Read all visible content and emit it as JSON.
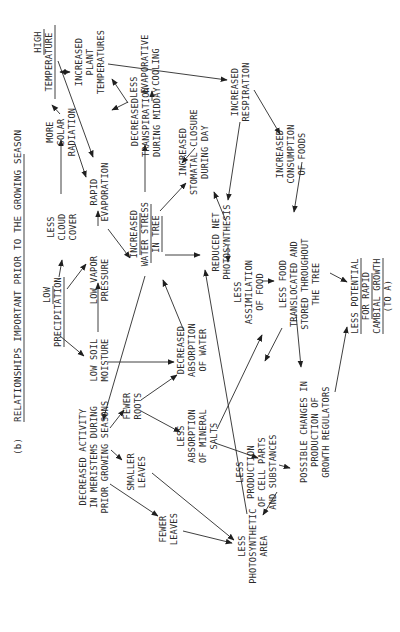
{
  "title": {
    "label": "(b)",
    "text": "RELATIONSHIPS IMPORTANT PRIOR TO THE GROWING SEASON"
  },
  "nodes": {
    "low_precipitation": {
      "lines": [
        "LOW",
        "PRECIPITATION"
      ],
      "underlined": true
    },
    "high_temperature": {
      "lines": [
        "HIGH",
        "TEMPERATURE"
      ],
      "underlined": true
    },
    "increased_plant_temperatures": {
      "lines": [
        "INCREASED",
        "PLANT",
        "TEMPERATURES"
      ]
    },
    "less_cloud_cover": {
      "lines": [
        "LESS",
        "CLOUD",
        "COVER"
      ]
    },
    "more_solar_radiation": {
      "lines": [
        "MORE",
        "SOLAR",
        "RADIATION"
      ]
    },
    "low_vapor_pressure": {
      "lines": [
        "LOW VAPOR",
        "PRESSURE"
      ]
    },
    "rapid_evaporation": {
      "lines": [
        "RAPID",
        "EVAPORATION"
      ]
    },
    "less_evaporative_cooling": {
      "lines": [
        "LESS",
        "EVAPORATIVE",
        "COOLING"
      ]
    },
    "decreased_transpiration": {
      "lines": [
        "DECREASED",
        "TRANSPIRATION",
        "DURING MIDDAY"
      ]
    },
    "increased_stomatal_closure": {
      "lines": [
        "INCREASED",
        "STOMATAL CLOSURE",
        "DURING DAY"
      ]
    },
    "increased_respiration": {
      "lines": [
        "INCREASED",
        "RESPIRATION"
      ]
    },
    "increased_consumption": {
      "lines": [
        "INCREASED",
        "CONSUMPTION",
        "OF FOODS"
      ]
    },
    "low_soil_moisture": {
      "lines": [
        "LOW SOIL",
        "MOISTURE"
      ]
    },
    "increased_water_stress": {
      "lines": [
        "INCREASED",
        "WATER STRESS",
        "IN TREE"
      ],
      "underlined": true
    },
    "reduced_net_photosynthesis": {
      "lines": [
        "REDUCED NET",
        "PHOTOSYNTHESIS"
      ]
    },
    "less_assimilation": {
      "lines": [
        "LESS",
        "ASSIMILATION",
        "OF FOOD"
      ]
    },
    "less_food_translocated": {
      "lines": [
        "LESS FOOD",
        "TRANSLOCATED AND",
        "STORED THROUGHOUT",
        "THE TREE"
      ]
    },
    "less_potential": {
      "lines": [
        "LESS POTENTIAL",
        "FOR RAPID",
        "CAMBIAL GROWTH",
        "(TO A)"
      ],
      "underlined": true
    },
    "decreased_absorption_water": {
      "lines": [
        "DECREASED",
        "ABSORPTION",
        "OF WATER"
      ]
    },
    "fewer_roots": {
      "lines": [
        "FEWER",
        "ROOTS"
      ]
    },
    "decreased_activity_meristems": {
      "lines": [
        "DECREASED ACTIVITY",
        "IN MERISTEMS DURING",
        "PRIOR GROWING SEASONS"
      ]
    },
    "less_absorption_mineral": {
      "lines": [
        "LESS",
        "ABSORPTION",
        "OF MINERAL",
        "SALTS"
      ]
    },
    "less_production_cell_parts": {
      "lines": [
        "LESS",
        "PRODUCTION",
        "OF CELL PARTS",
        "AND SUBSTANCES"
      ]
    },
    "possible_changes_regulators": {
      "lines": [
        "POSSIBLE CHANGES IN",
        "PRODUCTION OF",
        "GROWTH REGULATORS"
      ]
    },
    "smaller_leaves": {
      "lines": [
        "SMALLER",
        "LEAVES"
      ]
    },
    "fewer_leaves": {
      "lines": [
        "FEWER",
        "LEAVES"
      ]
    },
    "less_photosynthetic_area": {
      "lines": [
        "LESS",
        "PHOTOSYNTHETIC",
        "AREA"
      ]
    }
  },
  "edges": [
    [
      "low_precipitation",
      "less_cloud_cover"
    ],
    [
      "low_precipitation",
      "low_vapor_pressure"
    ],
    [
      "low_precipitation",
      "low_soil_moisture"
    ],
    [
      "less_cloud_cover",
      "more_solar_radiation"
    ],
    [
      "more_solar_radiation",
      "high_temperature"
    ],
    [
      "high_temperature",
      "increased_plant_temperatures"
    ],
    [
      "increased_plant_temperatures",
      "high_temperature"
    ],
    [
      "high_temperature",
      "rapid_evaporation"
    ],
    [
      "more_solar_radiation",
      "rapid_evaporation"
    ],
    [
      "low_vapor_pressure",
      "rapid_evaporation"
    ],
    [
      "low_soil_moisture",
      "low_vapor_pressure"
    ],
    [
      "rapid_evaporation",
      "increased_water_stress"
    ],
    [
      "increased_water_stress",
      "decreased_transpiration"
    ],
    [
      "decreased_transpiration",
      "less_evaporative_cooling"
    ],
    [
      "less_evaporative_cooling",
      "increased_plant_temperatures"
    ],
    [
      "increased_plant_temperatures",
      "increased_respiration"
    ],
    [
      "increased_respiration",
      "increased_consumption"
    ],
    [
      "increased_respiration",
      "reduced_net_photosynthesis"
    ],
    [
      "increased_stomatal_closure",
      "decreased_transpiration"
    ],
    [
      "increased_water_stress",
      "increased_stomatal_closure"
    ],
    [
      "reduced_net_photosynthesis",
      "increased_stomatal_closure"
    ],
    [
      "increased_water_stress",
      "reduced_net_photosynthesis"
    ],
    [
      "increased_water_stress",
      "decreased_activity_meristems"
    ],
    [
      "reduced_net_photosynthesis",
      "less_assimilation"
    ],
    [
      "less_assimilation",
      "less_food_translocated"
    ],
    [
      "increased_consumption",
      "less_food_translocated"
    ],
    [
      "less_food_translocated",
      "less_potential"
    ],
    [
      "less_food_translocated",
      "less_production_cell_parts"
    ],
    [
      "less_food_translocated",
      "possible_changes_regulators"
    ],
    [
      "possible_changes_regulators",
      "less_potential"
    ],
    [
      "low_soil_moisture",
      "decreased_absorption_water"
    ],
    [
      "decreased_absorption_water",
      "increased_water_stress"
    ],
    [
      "fewer_roots",
      "decreased_absorption_water"
    ],
    [
      "fewer_roots",
      "less_absorption_mineral"
    ],
    [
      "decreased_activity_meristems",
      "fewer_roots"
    ],
    [
      "decreased_activity_meristems",
      "smaller_leaves"
    ],
    [
      "decreased_activity_meristems",
      "fewer_leaves"
    ],
    [
      "less_absorption_mineral",
      "less_assimilation"
    ],
    [
      "less_absorption_mineral",
      "less_production_cell_parts"
    ],
    [
      "less_production_cell_parts",
      "possible_changes_regulators"
    ],
    [
      "less_production_cell_parts",
      "less_photosynthetic_area"
    ],
    [
      "smaller_leaves",
      "less_photosynthetic_area"
    ],
    [
      "fewer_leaves",
      "less_photosynthetic_area"
    ],
    [
      "less_photosynthetic_area",
      "reduced_net_photosynthesis"
    ]
  ]
}
